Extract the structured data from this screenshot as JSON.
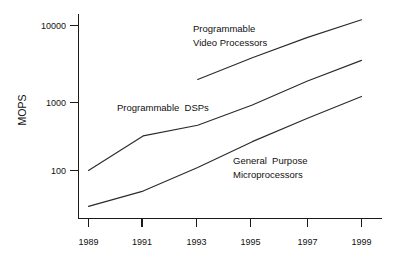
{
  "chart_data": {
    "type": "line",
    "title": "",
    "subtitle": "",
    "xlabel": "",
    "ylabel": "MOPS",
    "yscale": "log",
    "ylim": [
      30,
      20000
    ],
    "xlim": [
      1989,
      1999
    ],
    "grid": false,
    "legend_position": "inline-annotations",
    "x_ticks": [
      "1989",
      "1991",
      "1993",
      "1995",
      "1997",
      "1999"
    ],
    "y_ticks": [
      "100",
      "1000",
      "10000"
    ],
    "series": [
      {
        "name": "Programmable Video Processors",
        "label_lines": [
          "Programmable",
          "Video Processors"
        ],
        "x": [
          1993,
          1995,
          1997,
          1999
        ],
        "values": [
          1800,
          3600,
          6800,
          12000
        ]
      },
      {
        "name": "Programmable DSPs",
        "label_lines": [
          "Programmable  DSPs"
        ],
        "x": [
          1989,
          1991,
          1993,
          1995,
          1997,
          1999
        ],
        "values": [
          100,
          300,
          420,
          800,
          1700,
          3300
        ]
      },
      {
        "name": "General Purpose Microprocessors",
        "label_lines": [
          "General  Purpose",
          "Microprocessors"
        ],
        "x": [
          1989,
          1991,
          1993,
          1995,
          1997,
          1999
        ],
        "values": [
          32,
          52,
          110,
          250,
          520,
          1050
        ]
      }
    ]
  },
  "axis": {
    "y_title": "MOPS",
    "y_tick_10000": "10000",
    "y_tick_1000": "1000",
    "y_tick_100": "100",
    "x_tick_1989": "1989",
    "x_tick_1991": "1991",
    "x_tick_1993": "1993",
    "x_tick_1995": "1995",
    "x_tick_1997": "1997",
    "x_tick_1999": "1999"
  },
  "annotations": {
    "video_line1": "Programmable",
    "video_line2": "Video Processors",
    "dsp_line1": "Programmable  DSPs",
    "gp_line1": "General  Purpose",
    "gp_line2": "Microprocessors"
  }
}
